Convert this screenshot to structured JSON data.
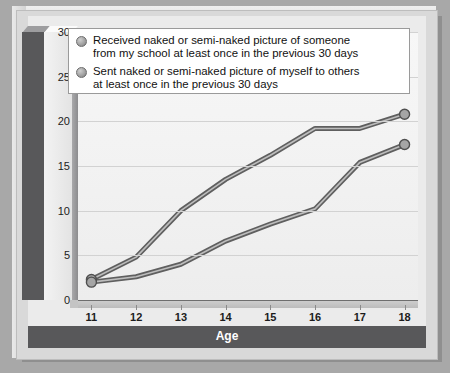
{
  "chart_data": {
    "type": "line",
    "title": "",
    "xlabel": "Age",
    "ylabel": "Percent",
    "x": [
      11,
      12,
      13,
      14,
      15,
      16,
      17,
      18
    ],
    "xtick_labels": [
      "11",
      "12",
      "13",
      "14",
      "15",
      "16",
      "17",
      "18"
    ],
    "ytick_labels": [
      "0",
      "5",
      "10",
      "15",
      "20",
      "25",
      "30"
    ],
    "yticks": [
      0,
      5,
      10,
      15,
      20,
      25,
      30
    ],
    "ylim": [
      0,
      30
    ],
    "xlim": [
      10.7,
      18.3
    ],
    "grid": "horizontal",
    "legend_position": "top",
    "markers": "endpoints-only",
    "series": [
      {
        "name": "Received naked or semi-naked picture of someone from my school at least once in the previous 30 days",
        "values": [
          2.3,
          4.8,
          10.0,
          13.5,
          16.2,
          19.2,
          19.2,
          20.8
        ],
        "color": "#7d7d7d"
      },
      {
        "name": "Sent naked or semi-naked picture of myself to others at least once in the previous 30 days",
        "values": [
          2.0,
          2.6,
          4.0,
          6.6,
          8.5,
          10.2,
          15.4,
          17.4
        ],
        "color": "#7d7d7d"
      }
    ]
  },
  "legend": {
    "items": [
      {
        "line1": "Received naked or semi-naked picture of someone",
        "line2": "from my school at least once in the previous 30 days"
      },
      {
        "line1": "Sent naked or semi-naked picture of myself to others",
        "line2": "at least once in the previous 30 days"
      }
    ]
  },
  "axes": {
    "y_title": "Percent",
    "x_title": "Age"
  },
  "colors": {
    "panel": "#d9d9d9",
    "plot_background": "#f2f2f2",
    "axis_band": "#58585a",
    "line": "#7d7d7d",
    "gridline": "#d2d2d2"
  }
}
